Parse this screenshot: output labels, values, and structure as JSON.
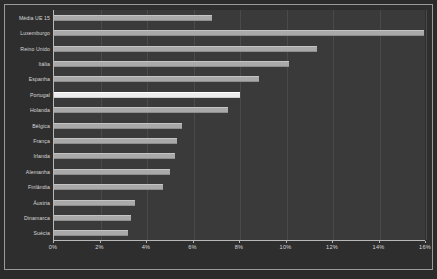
{
  "chart_data": {
    "type": "bar",
    "orientation": "horizontal",
    "title": "",
    "subtitle": "",
    "xlabel": "",
    "ylabel": "",
    "xlim": [
      0,
      16
    ],
    "xtick_labels": [
      "0%",
      "2%",
      "4%",
      "6%",
      "8%",
      "10%",
      "12%",
      "14%",
      "16%"
    ],
    "xtick_values": [
      0,
      2,
      4,
      6,
      8,
      10,
      12,
      14,
      16
    ],
    "grid": true,
    "grid_axis": "x",
    "legend": false,
    "unit": "%",
    "categories": [
      "Média UE 15",
      "Luxemburgo",
      "Reino Unido",
      "Itália",
      "Espanha",
      "Portugal",
      "Holanda",
      "Bélgica",
      "França",
      "Irlanda",
      "Alemanha",
      "Finlândia",
      "Áustria",
      "Dinamarca",
      "Suécia"
    ],
    "values": [
      6.8,
      15.9,
      11.3,
      10.1,
      8.8,
      8.0,
      7.5,
      5.5,
      5.3,
      5.2,
      5.0,
      4.7,
      3.5,
      3.3,
      3.2
    ],
    "highlight_category": "Portugal",
    "colors": {
      "bar": "#a9a9a9",
      "bar_highlight": "#ececec",
      "plot_background": "#3a3a3a",
      "figure_background": "#2b2b2b",
      "axis": "#b8b8b8",
      "gridline": "#4a4a4a",
      "text": "#d8d8d8"
    }
  }
}
